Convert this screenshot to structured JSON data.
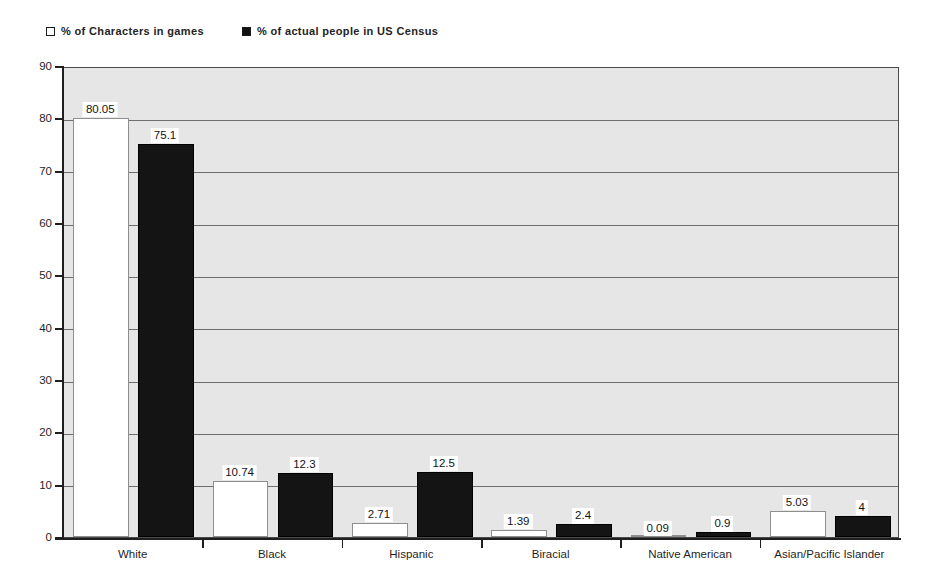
{
  "legend": {
    "position": "top-left",
    "entries": [
      {
        "label": "% of Characters in games",
        "marker": "open-square-icon",
        "color": "#ffffff"
      },
      {
        "label": "% of actual people in US Census",
        "marker": "filled-square-icon",
        "color": "#141414"
      }
    ]
  },
  "chart_data": {
    "type": "bar",
    "title": "",
    "subtitle": "",
    "xlabel": "",
    "ylabel": "",
    "ylim": [
      0,
      90
    ],
    "yticks": [
      0,
      10,
      20,
      30,
      40,
      50,
      60,
      70,
      80,
      90
    ],
    "grid": true,
    "grid_axis": "y",
    "legend_position": "top-left",
    "categories": [
      "White",
      "Black",
      "Hispanic",
      "Biracial",
      "Native American",
      "Asian/Pacific Islander"
    ],
    "series": [
      {
        "name": "% of Characters in games",
        "color": "#ffffff",
        "values": [
          80.05,
          10.74,
          2.71,
          1.39,
          0.09,
          5.03
        ],
        "labels": [
          "80.05",
          "10.74",
          "2.71",
          "1.39",
          "0.09",
          "5.03"
        ]
      },
      {
        "name": "% of actual people in US Census",
        "color": "#141414",
        "values": [
          75.1,
          12.3,
          12.5,
          2.4,
          0.9,
          4
        ],
        "labels": [
          "75.1",
          "12.3",
          "12.5",
          "2.4",
          "0.9",
          "4"
        ]
      }
    ]
  },
  "style": {
    "plot_background": "#e6e6e6",
    "gridline_color": "#6f6f6f",
    "axis_color": "#1f1f1f",
    "page_background": "#ffffff"
  }
}
